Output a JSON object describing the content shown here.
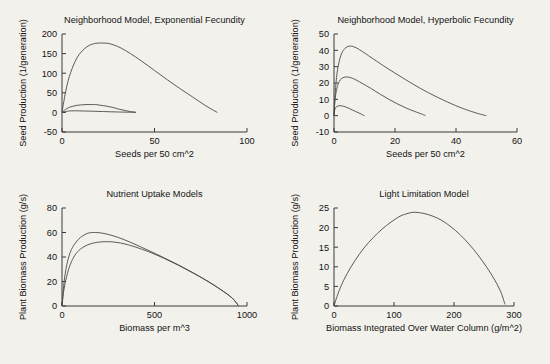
{
  "figure": {
    "background": "#f2f1ec",
    "axis_color": "#3a3a3a",
    "curve_color": "#4a4a4a",
    "panel_count": 4
  },
  "chart_data": [
    {
      "id": "neighborhood-exponential",
      "type": "line",
      "title": "Neighborhood Model, Exponential Fecundity",
      "xlabel": "Seeds per 50 cm^2",
      "ylabel": "Seed Production (1/generation)",
      "xlim": [
        0,
        100
      ],
      "ylim": [
        -50,
        200
      ],
      "xticks": [
        0,
        50,
        100
      ],
      "xticklabels": [
        "0",
        "50",
        "100"
      ],
      "yticks": [
        -50,
        0,
        50,
        100,
        150,
        200
      ],
      "yticklabels": [
        "-50",
        "0",
        "50",
        "100",
        "150",
        "200"
      ],
      "grid": false,
      "legend": "none",
      "series": [
        {
          "name": "high fecundity",
          "x": [
            0,
            1,
            2,
            4,
            7,
            10,
            14,
            18,
            22,
            25,
            28,
            32,
            37,
            43,
            50,
            57,
            64,
            71,
            77,
            82,
            84
          ],
          "y": [
            0,
            28,
            54,
            92,
            129,
            152,
            169,
            176,
            177,
            176,
            172,
            164,
            150,
            131,
            107,
            83,
            60,
            38,
            19,
            5,
            0
          ]
        },
        {
          "name": "medium fecundity",
          "x": [
            0,
            1,
            2,
            4,
            7,
            10,
            13,
            16,
            18,
            21,
            24,
            28,
            31,
            34,
            37,
            39,
            40
          ],
          "y": [
            0,
            4,
            8,
            13,
            17,
            19,
            20,
            20,
            20,
            18,
            16,
            12,
            8,
            5,
            2,
            1,
            0
          ]
        },
        {
          "name": "low fecundity",
          "x": [
            0,
            1,
            2,
            4,
            6,
            9,
            12,
            15,
            18,
            22,
            26,
            30,
            34,
            38,
            40
          ],
          "y": [
            0,
            1.5,
            2.5,
            3.5,
            4,
            4,
            3.6,
            3.2,
            2.8,
            2.2,
            1.6,
            1.1,
            0.7,
            0.3,
            0
          ]
        }
      ]
    },
    {
      "id": "neighborhood-hyperbolic",
      "type": "line",
      "title": "Neighborhood Model, Hyperbolic Fecundity",
      "xlabel": "Seeds per 50 cm^2",
      "ylabel": "Seed Production (1/generation)",
      "xlim": [
        0,
        60
      ],
      "ylim": [
        -10,
        50
      ],
      "xticks": [
        0,
        20,
        40,
        60
      ],
      "xticklabels": [
        "0",
        "20",
        "40",
        "60"
      ],
      "yticks": [
        -10,
        0,
        10,
        20,
        30,
        40,
        50
      ],
      "yticklabels": [
        "-10",
        "0",
        "10",
        "20",
        "30",
        "40",
        "50"
      ],
      "grid": false,
      "legend": "none",
      "series": [
        {
          "name": "high fecundity",
          "x": [
            0,
            0.4,
            1,
            1.8,
            2.6,
            3.5,
            4.5,
            5.5,
            6.5,
            8,
            10,
            13,
            17,
            21,
            26,
            31,
            36,
            41,
            45,
            48,
            50
          ],
          "y": [
            0,
            14,
            26,
            34,
            38.5,
            41,
            42.3,
            42.6,
            42.2,
            40.8,
            38.4,
            34.6,
            29.6,
            24.9,
            19.2,
            14,
            9.4,
            5.3,
            2.6,
            0.9,
            0
          ]
        },
        {
          "name": "medium fecundity",
          "x": [
            0,
            0.3,
            0.8,
            1.4,
            2.1,
            3,
            4,
            5,
            6,
            7.5,
            9.5,
            12,
            15,
            18,
            21,
            24,
            27,
            29,
            30
          ],
          "y": [
            0,
            9,
            15.5,
            19.5,
            22,
            23.3,
            23.7,
            23.5,
            22.9,
            21.6,
            19.5,
            16.8,
            13.3,
            10,
            7,
            4.4,
            2.2,
            0.8,
            0
          ]
        },
        {
          "name": "low fecundity",
          "x": [
            0,
            0.2,
            0.5,
            0.9,
            1.4,
            2,
            2.6,
            3.2,
            4,
            5,
            6,
            7,
            8,
            9,
            9.6,
            10
          ],
          "y": [
            0,
            3.2,
            4.8,
            5.6,
            6,
            6.1,
            6,
            5.7,
            5.2,
            4.4,
            3.5,
            2.6,
            1.8,
            0.9,
            0.3,
            0
          ]
        }
      ]
    },
    {
      "id": "nutrient-uptake",
      "type": "line",
      "title": "Nutrient Uptake Models",
      "xlabel": "Biomass per m^3",
      "ylabel": "Plant Biomass Production (g/s)",
      "xlim": [
        0,
        1000
      ],
      "ylim": [
        0,
        80
      ],
      "xticks": [
        0,
        500,
        1000
      ],
      "xticklabels": [
        "0",
        "500",
        "1000"
      ],
      "yticks": [
        0,
        20,
        40,
        60,
        80
      ],
      "yticklabels": [
        "0",
        "20",
        "40",
        "60",
        "80"
      ],
      "grid": false,
      "legend": "none",
      "series": [
        {
          "name": "model A",
          "x": [
            0,
            10,
            25,
            45,
            70,
            100,
            140,
            180,
            220,
            270,
            330,
            400,
            470,
            550,
            630,
            710,
            790,
            860,
            920,
            955
          ],
          "y": [
            0,
            18,
            33,
            44,
            51,
            56,
            59.4,
            60,
            59.4,
            57.6,
            54.5,
            50,
            45.2,
            39.5,
            33.5,
            27,
            20,
            13.2,
            6.5,
            0
          ]
        },
        {
          "name": "model B",
          "x": [
            0,
            10,
            25,
            45,
            70,
            100,
            140,
            190,
            240,
            280,
            330,
            400,
            470,
            550,
            630,
            710,
            790,
            860,
            920,
            955
          ],
          "y": [
            0,
            13,
            24,
            34,
            41.5,
            46.5,
            50,
            52,
            52.5,
            52.2,
            51,
            48,
            44.2,
            39,
            33.2,
            26.8,
            20,
            13.2,
            6.5,
            0
          ]
        }
      ]
    },
    {
      "id": "light-limitation",
      "type": "line",
      "title": "Light Limitation Model",
      "xlabel": "Biomass Integrated Over Water Column (g/m^2)",
      "ylabel": "Plant Biomass Production (g/s)",
      "xlim": [
        0,
        300
      ],
      "ylim": [
        0,
        25
      ],
      "xticks": [
        0,
        100,
        200,
        300
      ],
      "xticklabels": [
        "0",
        "100",
        "200",
        "300"
      ],
      "yticks": [
        0,
        5,
        10,
        15,
        20,
        25
      ],
      "yticklabels": [
        "0",
        "5",
        "10",
        "15",
        "20",
        "25"
      ],
      "grid": false,
      "legend": "none",
      "series": [
        {
          "name": "light limitation",
          "x": [
            0,
            5,
            12,
            22,
            35,
            50,
            65,
            80,
            95,
            110,
            125,
            135,
            150,
            165,
            180,
            195,
            210,
            225,
            240,
            255,
            268,
            278,
            285
          ],
          "y": [
            0,
            2.4,
            5.2,
            8.3,
            11.6,
            14.8,
            17.4,
            19.6,
            21.4,
            22.9,
            23.7,
            23.9,
            23.6,
            22.9,
            21.8,
            20.2,
            18.2,
            15.8,
            13.0,
            9.8,
            6.6,
            3.6,
            0.4
          ]
        }
      ]
    }
  ]
}
